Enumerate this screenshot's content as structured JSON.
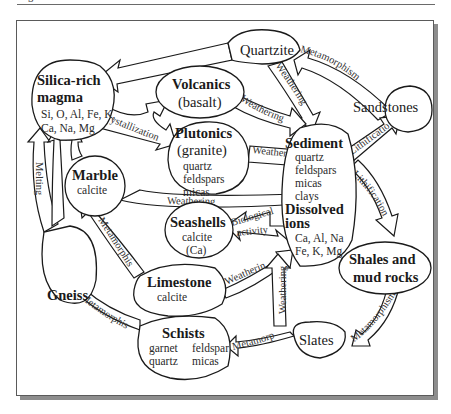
{
  "diagram": {
    "type": "rock-cycle",
    "nodes": {
      "silica_magma": {
        "title_1": "Silica-rich",
        "title_2": "magma",
        "sub_1": "Si, O, Al, Fe, K,",
        "sub_2": "Ca, Na, Mg"
      },
      "quartzite": {
        "title": "Quartzite"
      },
      "volcanics": {
        "title": "Volcanics",
        "sub": "(basalt)"
      },
      "plutonics": {
        "title": "Plutonics",
        "sub": "(granite)",
        "minerals": [
          "quartz",
          "feldspars",
          "micas"
        ]
      },
      "sandstones": {
        "title": "Sandstones"
      },
      "sediment": {
        "title": "Sediment",
        "minerals": [
          "quartz",
          "feldspars",
          "micas",
          "clays"
        ],
        "title_2a": "Dissolved",
        "title_2b": "ions",
        "ions_1": "Ca, Al, Na",
        "ions_2": "Fe, K, Mg"
      },
      "marble": {
        "title": "Marble",
        "sub": "calcite"
      },
      "seashells": {
        "title": "Seashells",
        "sub_1": "calcite",
        "sub_2": "(Ca)"
      },
      "gneiss": {
        "title": "Gneiss"
      },
      "limestone": {
        "title": "Limestone",
        "sub": "calcite"
      },
      "shales": {
        "title_1": "Shales and",
        "title_2": "mud rocks"
      },
      "schists": {
        "title": "Schists",
        "minerals_left": [
          "garnet",
          "quartz"
        ],
        "minerals_right": [
          "feldspar",
          "micas"
        ]
      },
      "slates": {
        "title": "Slates"
      }
    },
    "edges": [
      {
        "id": "quartzite-to-magma",
        "label": "Melting"
      },
      {
        "id": "sandstones-to-quartzite",
        "label": "Metamorphism"
      },
      {
        "id": "quartzite-to-sediment",
        "label": "Weathering"
      },
      {
        "id": "magma-crystallization",
        "label": "Crystallization"
      },
      {
        "id": "volcanics-to-sediment",
        "label": "Weathering"
      },
      {
        "id": "plutonics-to-sediment",
        "label": "Weathering"
      },
      {
        "id": "sediment-to-sandstones",
        "label": "Lithification"
      },
      {
        "id": "marble-to-sediment",
        "label": "Weathering"
      },
      {
        "id": "sediment-to-shales",
        "label": "Lithification"
      },
      {
        "id": "sediment-to-seashells",
        "label_1": "Biological",
        "label_2": "activity"
      },
      {
        "id": "gneiss-to-magma",
        "label": "Melting"
      },
      {
        "id": "limestone-to-marble",
        "label": "Metamorphism"
      },
      {
        "id": "limestone-to-sediment",
        "label": "Weathering"
      },
      {
        "id": "schists-to-gneiss",
        "label": "Metamorphism"
      },
      {
        "id": "slates-to-sediment",
        "label": "Weathering"
      },
      {
        "id": "shales-to-slates",
        "label": "Metamorphism"
      },
      {
        "id": "slates-to-schists",
        "label": "Metamorphism"
      }
    ]
  }
}
